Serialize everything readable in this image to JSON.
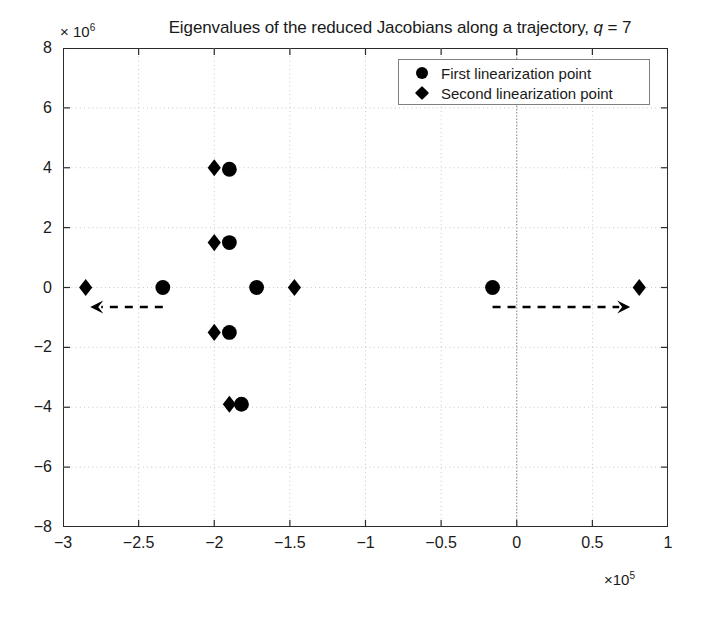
{
  "chart_data": {
    "type": "scatter",
    "title": "Eigenvalues of the reduced Jacobians along a trajectory, q = 7",
    "title_plain": "Eigenvalues of the reduced Jacobians along a trajectory,",
    "title_italic_var": "q",
    "title_equals": "= 7",
    "xlabel": "",
    "ylabel": "",
    "x_exponent_label": "×10",
    "x_exponent_power": "5",
    "y_exponent_label": "× 10",
    "y_exponent_power": "6",
    "x_multiplier": 100000,
    "y_multiplier": 1000000,
    "xlim": [
      -3,
      1
    ],
    "ylim": [
      -8,
      8
    ],
    "xticks": [
      "-3",
      "-2.5",
      "-2",
      "-1.5",
      "-1",
      "-0.5",
      "0",
      "0.5",
      "1"
    ],
    "xtick_values": [
      -3,
      -2.5,
      -2,
      -1.5,
      -1,
      -0.5,
      0,
      0.5,
      1
    ],
    "yticks": [
      "8",
      "6",
      "4",
      "2",
      "0",
      "-2",
      "-4",
      "-6",
      "-8"
    ],
    "ytick_values": [
      8,
      6,
      4,
      2,
      0,
      -2,
      -4,
      -6,
      -8
    ],
    "grid": true,
    "grid_style": "dotted",
    "grid_color": "#c8c8c8",
    "zero_line_x": 0,
    "zero_line_emphasized": true,
    "legend_position": "top-right",
    "marker_color": "#000000",
    "series": [
      {
        "name": "First linearization point",
        "marker": "circle",
        "points": [
          [
            -2.34,
            0.0
          ],
          [
            -1.9,
            3.95
          ],
          [
            -1.9,
            1.5
          ],
          [
            -1.72,
            0.0
          ],
          [
            -1.9,
            -1.5
          ],
          [
            -1.82,
            -3.9
          ],
          [
            -0.16,
            0.0
          ]
        ]
      },
      {
        "name": "Second linearization point",
        "marker": "diamond",
        "points": [
          [
            -2.85,
            0.0
          ],
          [
            -2.0,
            4.0
          ],
          [
            -2.0,
            1.5
          ],
          [
            -1.47,
            0.0
          ],
          [
            -2.0,
            -1.5
          ],
          [
            -1.9,
            -3.9
          ],
          [
            0.81,
            0.0
          ]
        ]
      }
    ],
    "annotations": [
      {
        "type": "arrow",
        "name": "left-migration-arrow",
        "style": "dashed",
        "direction": "left",
        "x_start": -2.34,
        "x_end": -2.82,
        "y": -0.65
      },
      {
        "type": "arrow",
        "name": "right-migration-arrow",
        "style": "dashed",
        "direction": "right",
        "x_start": -0.16,
        "x_end": 0.75,
        "y": -0.65
      }
    ]
  },
  "legend": {
    "items": [
      {
        "label": "First linearization point",
        "marker": "circle"
      },
      {
        "label": "Second linearization point",
        "marker": "diamond"
      }
    ]
  }
}
